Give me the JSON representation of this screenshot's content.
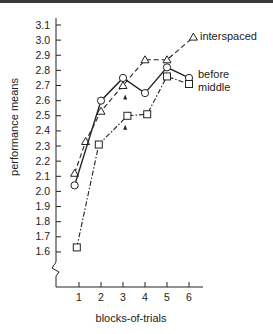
{
  "chart_data": {
    "type": "line",
    "title": "",
    "xlabel": "blocks-of-trials",
    "ylabel": "performance means",
    "x_ticks": [
      "1",
      "2",
      "3",
      "4",
      "5",
      "6"
    ],
    "y_ticks": [
      "1.6",
      "1.7",
      "1.8",
      "1.9",
      "2.0",
      "2.1",
      "2.2",
      "2.3",
      "2.4",
      "2.5",
      "2.6",
      "2.7",
      "2.8",
      "2.9",
      "3.0",
      "3.1"
    ],
    "ylim": [
      1.6,
      3.1
    ],
    "axis_break": true,
    "grid": false,
    "legend_position": "inline-right",
    "series": [
      {
        "name": "interspaced",
        "marker": "triangle",
        "line": "dashed",
        "x": [
          0.8,
          1.3,
          2,
          3,
          4,
          5,
          6.2
        ],
        "values": [
          2.12,
          2.33,
          2.53,
          2.7,
          2.87,
          2.87,
          3.02
        ]
      },
      {
        "name": "before",
        "marker": "circle",
        "line": "solid",
        "x": [
          0.8,
          2,
          3,
          4,
          5,
          6
        ],
        "values": [
          2.04,
          2.6,
          2.75,
          2.65,
          2.82,
          2.75
        ]
      },
      {
        "name": "middle",
        "marker": "square",
        "line": "dash-dot",
        "x": [
          0.9,
          1.9,
          3.2,
          4.1,
          5,
          6
        ],
        "values": [
          1.63,
          2.31,
          2.5,
          2.51,
          2.76,
          2.71
        ]
      }
    ],
    "annotations": [
      {
        "type": "arrow-up",
        "x": 3.1,
        "y": 2.68,
        "note": "arrowhead below interspaced point at block 3"
      },
      {
        "type": "arrow-up",
        "x": 3.1,
        "y": 2.48,
        "note": "arrowhead below middle point at block 3"
      }
    ]
  },
  "labels": {
    "xlabel": "blocks-of-trials",
    "ylabel": "performance means",
    "legend_interspaced": "interspaced",
    "legend_before": "before",
    "legend_middle": "middle"
  }
}
